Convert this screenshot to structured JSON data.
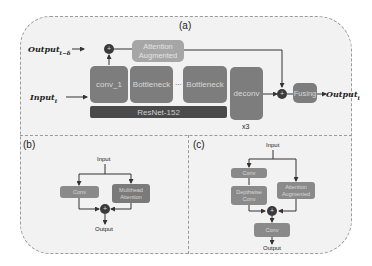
{
  "panels": {
    "a": {
      "label": "(a)",
      "input_label": "Input",
      "input_sub": "t",
      "prev_output_label": "Output",
      "prev_output_sub": "t−δ",
      "output_label": "Output",
      "output_sub": "t",
      "blocks": {
        "attention": "Attention Augmented",
        "conv1": "conv_1",
        "bottleneck1": "Bottleneck",
        "ellipsis": "...",
        "bottleneck2": "Bottleneck",
        "backbone": "ResNet-152",
        "deconv": "deconv",
        "repeat": "x3",
        "fusing": "Fusing"
      },
      "operator": "+"
    },
    "b": {
      "label": "(b)",
      "input": "Input",
      "output": "Output",
      "blocks": {
        "conv": "Conv",
        "mha": "Multihead Attention"
      },
      "operator": "+"
    },
    "c": {
      "label": "(c)",
      "input": "Input",
      "output": "Output",
      "blocks": {
        "conv1": "Conv",
        "depthwise": "Depthwise Conv",
        "attention": "Attention Augmented",
        "conv2": "Conv"
      },
      "operator": "+"
    }
  },
  "colors": {
    "block": "#7d7d7d",
    "block_light": "#a6a6a6",
    "backbone": "#4a4a4a",
    "operator": "#3a3a3a",
    "background": "#f2f2f2",
    "border": "#9a9a9a"
  }
}
